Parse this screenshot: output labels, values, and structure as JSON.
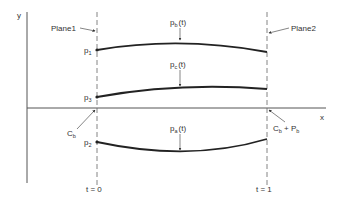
{
  "axes": {
    "y_label": "y",
    "x_label": "x"
  },
  "planes": {
    "plane1": "Plane1",
    "plane2": "Plane2"
  },
  "points": {
    "p1": {
      "base": "p",
      "sub": "1"
    },
    "p3": {
      "base": "p",
      "sub": "3"
    },
    "p2": {
      "base": "p",
      "sub": "2"
    }
  },
  "curves": {
    "pb": {
      "base": "p",
      "sub": "b",
      "arg": "(t)"
    },
    "pc": {
      "base": "p",
      "sub": "c",
      "arg": "(t)"
    },
    "pa": {
      "base": "p",
      "sub": "a",
      "arg": "(t)"
    }
  },
  "annotations": {
    "cb": {
      "base": "C",
      "sub": "b"
    },
    "cb_pb": {
      "c": "C",
      "c_sub": "b",
      "plus": " + ",
      "p": "P",
      "p_sub": "b"
    }
  },
  "time_labels": {
    "t0": "t = 0",
    "t1": "t = 1"
  },
  "colors": {
    "line": "#222222",
    "axis": "#555555",
    "text": "#333333"
  }
}
